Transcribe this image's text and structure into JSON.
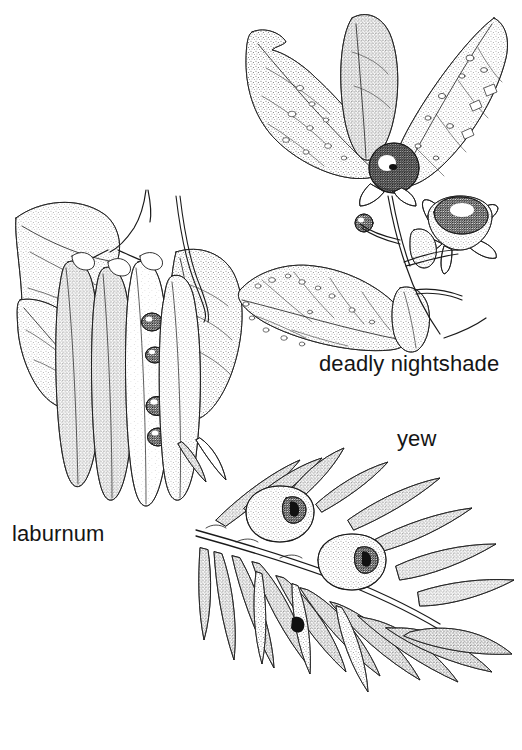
{
  "page": {
    "width": 522,
    "height": 750,
    "background_color": "#ffffff",
    "ink_color": "#1a1a1a",
    "medium": "pen-and-ink stipple botanical illustration",
    "cropped_header_remnant": "                                              "
  },
  "captions": {
    "laburnum": "laburnum",
    "deadly_nightshade": "deadly nightshade",
    "yew": "yew"
  },
  "figures": [
    {
      "id": "laburnum",
      "label": "laburnum",
      "label_position": {
        "x": 12,
        "y": 521
      },
      "bounds": {
        "x": 8,
        "y": 185,
        "width": 240,
        "height": 330
      },
      "description": "Laburnum branch with hanging seed pods, split pods revealing dark seeds, and broad ovate leaflets",
      "parts": [
        "leaflet",
        "seed-pod",
        "split-pod",
        "seed",
        "stem",
        "tendril"
      ],
      "seed_count_visible": 4,
      "pod_count": 5
    },
    {
      "id": "deadly-nightshade",
      "label": "deadly nightshade",
      "label_position": {
        "x": 319,
        "y": 351
      },
      "bounds": {
        "x": 232,
        "y": 8,
        "width": 285,
        "height": 340
      },
      "description": "Deadly nightshade sprig with large spotted ovate leaves, a dark glossy black berry and a star-shaped calyx with a second berry",
      "parts": [
        "leaf",
        "berry",
        "calyx",
        "stem",
        "bud"
      ],
      "berry_count": 3
    },
    {
      "id": "yew",
      "label": "yew",
      "label_position": {
        "x": 397,
        "y": 426
      },
      "bounds": {
        "x": 175,
        "y": 440,
        "width": 340,
        "height": 305
      },
      "description": "Yew branch with two rows of flat linear needles and two cup-shaped red arils each showing the dark seed opening",
      "parts": [
        "needle",
        "aril",
        "twig",
        "seed-opening"
      ],
      "aril_count": 2
    }
  ]
}
